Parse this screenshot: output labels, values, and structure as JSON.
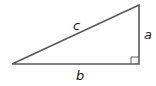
{
  "diagram": {
    "type": "right-triangle",
    "labels": {
      "hypotenuse": "c",
      "vertical_leg": "a",
      "horizontal_leg": "b"
    },
    "right_angle_marker": true,
    "colors": {
      "stroke": "#5a5a5a",
      "label": "#1a1a1a"
    }
  }
}
